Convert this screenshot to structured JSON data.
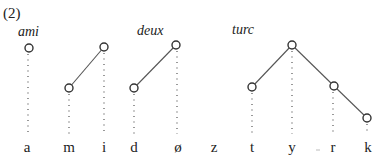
{
  "example_number": "(2)",
  "words": [
    {
      "label": "ami",
      "x": 18,
      "y": 36
    },
    {
      "label": "deux",
      "x": 137,
      "y": 35
    },
    {
      "label": "turc",
      "x": 232,
      "y": 34
    }
  ],
  "segments": [
    {
      "label": "a",
      "x": 27
    },
    {
      "label": "m",
      "x": 69
    },
    {
      "label": "i",
      "x": 104
    },
    {
      "label": "d",
      "x": 134
    },
    {
      "label": "ø",
      "x": 178
    },
    {
      "label": "z",
      "x": 214
    },
    {
      "label": "t",
      "x": 252
    },
    {
      "label": "y",
      "x": 292
    },
    {
      "label": "r",
      "x": 333
    },
    {
      "label": "k",
      "x": 368
    }
  ],
  "segment_baseline_y": 152,
  "nodes": [
    {
      "id": "ami-1",
      "x": 29,
      "y": 48
    },
    {
      "id": "ami-m",
      "x": 69,
      "y": 88
    },
    {
      "id": "ami-i",
      "x": 104,
      "y": 47
    },
    {
      "id": "deux-d",
      "x": 134,
      "y": 88
    },
    {
      "id": "deux-o",
      "x": 176,
      "y": 45
    },
    {
      "id": "turc-t",
      "x": 252,
      "y": 87
    },
    {
      "id": "turc-y",
      "x": 292,
      "y": 45
    },
    {
      "id": "turc-r",
      "x": 334,
      "y": 86
    },
    {
      "id": "turc-k",
      "x": 367,
      "y": 118
    }
  ],
  "association_lines": [
    {
      "from": "ami-m",
      "to": "ami-i"
    },
    {
      "from": "deux-d",
      "to": "deux-o"
    },
    {
      "from": "turc-t",
      "to": "turc-y"
    },
    {
      "from": "turc-y",
      "to": "turc-r"
    },
    {
      "from": "turc-r",
      "to": "turc-k"
    }
  ],
  "dotted_lines": [
    {
      "x": 28,
      "y1": 54,
      "y2": 134
    },
    {
      "x": 69,
      "y1": 94,
      "y2": 134
    },
    {
      "x": 104,
      "y1": 53,
      "y2": 134
    },
    {
      "x": 134,
      "y1": 94,
      "y2": 134
    },
    {
      "x": 177,
      "y1": 51,
      "y2": 134
    },
    {
      "x": 252,
      "y1": 93,
      "y2": 134
    },
    {
      "x": 292,
      "y1": 51,
      "y2": 134
    },
    {
      "x": 333,
      "y1": 92,
      "y2": 134
    },
    {
      "x": 367,
      "y1": 124,
      "y2": 134
    }
  ]
}
